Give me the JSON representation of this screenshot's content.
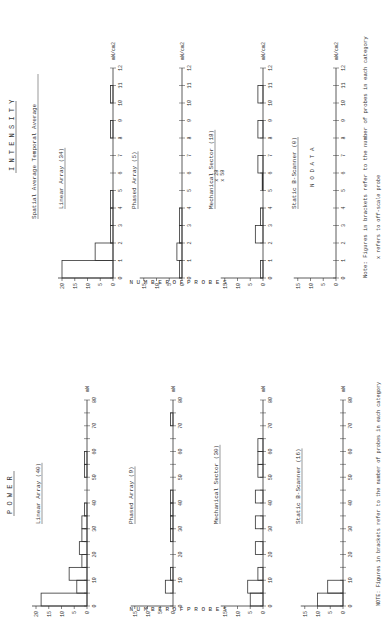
{
  "sections": {
    "power": {
      "title": "P O W E R",
      "unit": "mW",
      "x_ticks": [
        0,
        10,
        20,
        30,
        40,
        50,
        60,
        70,
        80
      ],
      "x_max": 80,
      "bin_width": 5
    },
    "intensity": {
      "title": "I N T E N S I T Y",
      "subtitle": "Spatial Average Temporal Average",
      "unit": "mW/cm2",
      "x_ticks": [
        0,
        1,
        2,
        3,
        4,
        5,
        6,
        7,
        8,
        9,
        10,
        11,
        12
      ],
      "x_max": 12,
      "bin_width": 1
    }
  },
  "y_axis_label": "N U M B E R   O F   P R O B E S",
  "notes": {
    "power": "NOTE: Figures in brackets refer to the number of probes in each category",
    "intensity_1": "Note: Figures in brackets refer to the number of probes in each category",
    "intensity_2": "x refers to off-scale probe"
  },
  "off_scale_marks": [
    "x 28",
    "x 58"
  ],
  "no_data": "N O   D A T A",
  "chart_data": [
    {
      "type": "bar",
      "section": "power",
      "title": "Linear Array (40)",
      "xlabel": "mW",
      "ylabel": "Number of probes",
      "bins": [
        [
          0,
          5
        ],
        [
          5,
          10
        ],
        [
          10,
          15
        ],
        [
          15,
          20
        ],
        [
          20,
          25
        ],
        [
          25,
          30
        ],
        [
          30,
          35
        ],
        [
          35,
          40
        ],
        [
          50,
          55
        ],
        [
          55,
          60
        ]
      ],
      "values": [
        18,
        4,
        7,
        2,
        3,
        2,
        2,
        1,
        1,
        1
      ],
      "yticks": [
        0,
        5,
        10,
        15,
        20
      ],
      "ylim": [
        0,
        20
      ],
      "xlim": [
        0,
        80
      ]
    },
    {
      "type": "bar",
      "section": "power",
      "title": "Phased Array (9)",
      "xlabel": "mW",
      "ylabel": "Number of probes",
      "bins": [
        [
          5,
          10
        ],
        [
          10,
          15
        ],
        [
          25,
          30
        ],
        [
          30,
          35
        ],
        [
          35,
          40
        ],
        [
          40,
          45
        ],
        [
          70,
          75
        ]
      ],
      "values": [
        3,
        1,
        1,
        1,
        1,
        1,
        1
      ],
      "yticks": [
        0,
        5,
        10,
        15
      ],
      "ylim": [
        0,
        15
      ],
      "xlim": [
        0,
        80
      ]
    },
    {
      "type": "bar",
      "section": "power",
      "title": "Mechanical Sector (30)",
      "xlabel": "mW",
      "ylabel": "Number of probes",
      "bins": [
        [
          0,
          5
        ],
        [
          5,
          10
        ],
        [
          10,
          15
        ],
        [
          20,
          25
        ],
        [
          30,
          35
        ],
        [
          40,
          45
        ],
        [
          50,
          55
        ],
        [
          55,
          60
        ],
        [
          60,
          65
        ]
      ],
      "values": [
        5,
        6,
        2,
        3,
        3,
        3,
        2,
        2,
        2
      ],
      "yticks": [
        0,
        5,
        10,
        15
      ],
      "ylim": [
        0,
        15
      ],
      "xlim": [
        0,
        80
      ]
    },
    {
      "type": "bar",
      "section": "power",
      "title": "Static B-Scanner (16)",
      "xlabel": "mW",
      "ylabel": "Number of probes",
      "bins": [
        [
          0,
          5
        ],
        [
          5,
          10
        ]
      ],
      "values": [
        10,
        6
      ],
      "yticks": [
        0,
        5,
        10,
        15
      ],
      "ylim": [
        0,
        15
      ],
      "xlim": [
        0,
        80
      ]
    },
    {
      "type": "bar",
      "section": "intensity",
      "title": "Linear Array (34)",
      "xlabel": "mW/cm2",
      "ylabel": "Number of probes",
      "bins": [
        [
          0,
          1
        ],
        [
          1,
          2
        ],
        [
          2,
          3
        ],
        [
          3,
          4
        ],
        [
          4,
          5
        ],
        [
          8,
          9
        ],
        [
          10,
          11
        ]
      ],
      "values": [
        20,
        7,
        1,
        1,
        1,
        1,
        1
      ],
      "yticks": [
        0,
        5,
        10,
        15,
        20
      ],
      "ylim": [
        0,
        20
      ],
      "xlim": [
        0,
        12
      ]
    },
    {
      "type": "bar",
      "section": "intensity",
      "title": "Phased Array (5)",
      "xlabel": "mW/cm2",
      "ylabel": "Number of probes",
      "bins": [
        [
          0,
          1
        ],
        [
          1,
          2
        ],
        [
          2,
          3
        ],
        [
          3,
          4
        ]
      ],
      "values": [
        1,
        2,
        1,
        1
      ],
      "yticks": [
        0,
        5,
        10,
        15
      ],
      "ylim": [
        0,
        15
      ],
      "xlim": [
        0,
        12
      ]
    },
    {
      "type": "bar",
      "section": "intensity",
      "title": "Mechanical Sector (18)",
      "xlabel": "mW/cm2",
      "ylabel": "Number of probes",
      "bins": [
        [
          0,
          1
        ],
        [
          2,
          3
        ],
        [
          3,
          4
        ],
        [
          5,
          6
        ],
        [
          6,
          7
        ],
        [
          8,
          9
        ],
        [
          10,
          11
        ]
      ],
      "values": [
        1,
        3,
        1,
        0.3,
        2,
        2,
        2
      ],
      "off_scale": [
        "x 28",
        "x 58"
      ],
      "yticks": [
        0,
        5,
        10,
        15
      ],
      "ylim": [
        0,
        15
      ],
      "xlim": [
        0,
        12
      ]
    },
    {
      "type": "bar",
      "section": "intensity",
      "title": "Static B-Scanner (0)",
      "xlabel": "mW/cm2",
      "ylabel": "Number of probes",
      "bins": [],
      "values": [],
      "annotation": "N O   D A T A",
      "yticks": [
        0,
        5,
        10,
        15
      ],
      "ylim": [
        0,
        15
      ],
      "xlim": [
        0,
        12
      ]
    }
  ]
}
